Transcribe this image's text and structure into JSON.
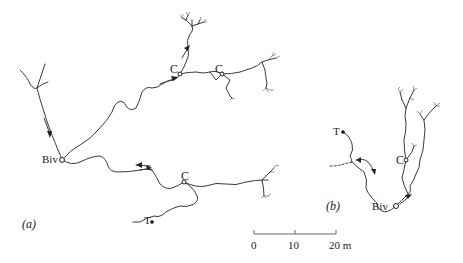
{
  "figure": {
    "panels": [
      {
        "id": "a",
        "label": "(a)",
        "nodes": {
          "bivouac": "Biv",
          "clusters": [
            "C",
            "C",
            "C"
          ],
          "terminus": "T"
        }
      },
      {
        "id": "b",
        "label": "(b)",
        "nodes": {
          "bivouac": "Biv",
          "clusters": [
            "C"
          ],
          "terminus": "T"
        }
      }
    ],
    "scale_bar": {
      "ticks": [
        "0",
        "10",
        "20 m"
      ],
      "unit": "m",
      "length": 20
    }
  },
  "labels": {
    "a_panel": "(a)",
    "a_biv": "Biv",
    "a_c1": "C",
    "a_c2": "C",
    "a_c3": "C",
    "a_t": "T",
    "b_panel": "(b)",
    "b_biv": "Biv",
    "b_c": "C",
    "b_t": "T",
    "scale_0": "0",
    "scale_10": "10",
    "scale_20": "20 m"
  },
  "colors": {
    "line": "#3a3a3a",
    "background": "#ffffff"
  }
}
